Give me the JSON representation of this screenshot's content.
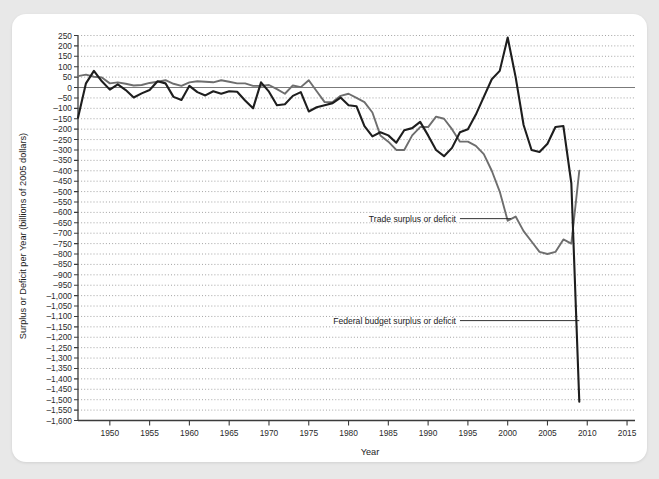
{
  "figure": {
    "background_color": "#e8e8e8",
    "card_color": "#ffffff"
  },
  "chart_data": {
    "type": "line",
    "title": "",
    "xlabel": "Year",
    "ylabel": "Surplus or Deficit per Year (billions of 2005 dollars)",
    "xlim": [
      1946,
      2016
    ],
    "ylim": [
      -1600,
      250
    ],
    "grid": true,
    "legend_position": "inline-annotations",
    "x_ticks": [
      1950,
      1955,
      1960,
      1965,
      1970,
      1975,
      1980,
      1985,
      1990,
      1995,
      2000,
      2005,
      2010,
      2015
    ],
    "x_tick_labels": [
      "1950",
      "1955",
      "1960",
      "1965",
      "1970",
      "1975",
      "1980",
      "1985",
      "1990",
      "1995",
      "2000",
      "2005",
      "2010",
      "2015"
    ],
    "y_ticks": [
      250,
      200,
      150,
      100,
      50,
      0,
      -50,
      -100,
      -150,
      -200,
      -250,
      -300,
      -350,
      -400,
      -450,
      -500,
      -550,
      -600,
      -650,
      -700,
      -750,
      -800,
      -850,
      -900,
      -950,
      -1000,
      -1050,
      -1100,
      -1150,
      -1200,
      -1250,
      -1300,
      -1350,
      -1400,
      -1450,
      -1500,
      -1550,
      -1600
    ],
    "y_tick_labels": [
      "250",
      "200",
      "150",
      "100",
      "50",
      "0",
      "–50",
      "–100",
      "–150",
      "–200",
      "–250",
      "–300",
      "–350",
      "–400",
      "–450",
      "–500",
      "–550",
      "–600",
      "–650",
      "–700",
      "–750",
      "–800",
      "–850",
      "–900",
      "–950",
      "–1,000",
      "–1,050",
      "–1,100",
      "–1,150",
      "–1,200",
      "–1,250",
      "–1,300",
      "–1,350",
      "–1,400",
      "–1,450",
      "–1,500",
      "–1,550",
      "–1,600"
    ],
    "series": [
      {
        "name": "Trade surplus or deficit",
        "color": "#6e6e6e",
        "width": 1.9,
        "x": [
          1946,
          1947,
          1948,
          1949,
          1950,
          1951,
          1952,
          1953,
          1954,
          1955,
          1956,
          1957,
          1958,
          1959,
          1960,
          1961,
          1962,
          1963,
          1964,
          1965,
          1966,
          1967,
          1968,
          1969,
          1970,
          1971,
          1972,
          1973,
          1974,
          1975,
          1976,
          1977,
          1978,
          1979,
          1980,
          1981,
          1982,
          1983,
          1984,
          1985,
          1986,
          1987,
          1988,
          1989,
          1990,
          1991,
          1992,
          1993,
          1994,
          1995,
          1996,
          1997,
          1998,
          1999,
          2000,
          2001,
          2002,
          2003,
          2004,
          2005,
          2006,
          2007,
          2008,
          2009
        ],
        "y": [
          55,
          62,
          52,
          48,
          20,
          25,
          18,
          10,
          12,
          22,
          28,
          35,
          18,
          8,
          25,
          30,
          28,
          25,
          35,
          28,
          20,
          20,
          8,
          8,
          12,
          -8,
          -30,
          10,
          2,
          35,
          -18,
          -70,
          -70,
          -40,
          -30,
          -50,
          -70,
          -120,
          -230,
          -260,
          -300,
          -300,
          -230,
          -190,
          -190,
          -140,
          -150,
          -200,
          -260,
          -260,
          -280,
          -320,
          -400,
          -500,
          -640,
          -620,
          -690,
          -740,
          -790,
          -800,
          -790,
          -730,
          -750,
          -400
        ]
      },
      {
        "name": "Federal budget surplus or deficit",
        "color": "#1e1e1e",
        "width": 2.1,
        "x": [
          1946,
          1947,
          1948,
          1949,
          1950,
          1951,
          1952,
          1953,
          1954,
          1955,
          1956,
          1957,
          1958,
          1959,
          1960,
          1961,
          1962,
          1963,
          1964,
          1965,
          1966,
          1967,
          1968,
          1969,
          1970,
          1971,
          1972,
          1973,
          1974,
          1975,
          1976,
          1977,
          1978,
          1979,
          1980,
          1981,
          1982,
          1983,
          1984,
          1985,
          1986,
          1987,
          1988,
          1989,
          1990,
          1991,
          1992,
          1993,
          1994,
          1995,
          1996,
          1997,
          1998,
          1999,
          2000,
          2001,
          2002,
          2003,
          2004,
          2005,
          2006,
          2007,
          2008,
          2009
        ],
        "y": [
          -145,
          20,
          80,
          30,
          -10,
          15,
          -12,
          -48,
          -28,
          -12,
          30,
          20,
          -45,
          -60,
          8,
          -22,
          -38,
          -18,
          -30,
          -18,
          -20,
          -62,
          -100,
          25,
          -20,
          -85,
          -80,
          -40,
          -22,
          -115,
          -95,
          -85,
          -75,
          -48,
          -85,
          -90,
          -185,
          -235,
          -215,
          -230,
          -265,
          -205,
          -195,
          -165,
          -230,
          -300,
          -330,
          -290,
          -215,
          -200,
          -130,
          -45,
          40,
          80,
          240,
          50,
          -180,
          -300,
          -310,
          -270,
          -190,
          -185,
          -460,
          -1510
        ]
      }
    ],
    "annotations": [
      {
        "label": "Trade surplus or deficit",
        "text_x": 1993.5,
        "text_y": -630,
        "leader_to_x": 2000.4,
        "leader_to_y": -630
      },
      {
        "label": "Federal budget surplus or deficit",
        "text_x": 1993.5,
        "text_y": -1120,
        "leader_to_x": 2009.0,
        "leader_to_y": -1120
      }
    ]
  }
}
